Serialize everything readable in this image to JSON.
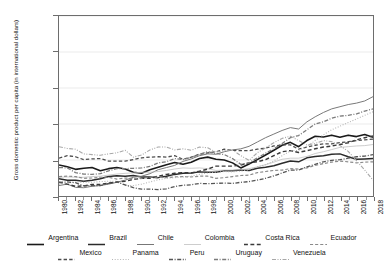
{
  "chart_data": {
    "type": "line",
    "title": "",
    "xlabel": "",
    "ylabel": "Gross domestic product per capita (in international dollars)",
    "grid": true,
    "legend_position": "bottom",
    "xlim": [
      1980,
      2018
    ],
    "ylim": [
      2000,
      27000
    ],
    "ytick_labels": [
      "2,000",
      "7,000",
      "12,000",
      "17,000",
      "22,000",
      "27,000"
    ],
    "ytick_values": [
      2000,
      7000,
      12000,
      17000,
      22000,
      27000
    ],
    "x": [
      1980,
      1981,
      1982,
      1983,
      1984,
      1985,
      1986,
      1987,
      1988,
      1989,
      1990,
      1991,
      1992,
      1993,
      1994,
      1995,
      1996,
      1997,
      1998,
      1999,
      2000,
      2001,
      2002,
      2003,
      2004,
      2005,
      2006,
      2007,
      2008,
      2009,
      2010,
      2011,
      2012,
      2013,
      2014,
      2015,
      2016,
      2017,
      2018
    ],
    "xtick_labels": [
      "1980",
      "1982",
      "1984",
      "1986",
      "1988",
      "1990",
      "1992",
      "1994",
      "1996",
      "1998",
      "2000",
      "2002",
      "2004",
      "2006",
      "2008",
      "2010",
      "2012",
      "2014",
      "2016",
      "2018"
    ],
    "series": [
      {
        "name": "Argentina",
        "style": "solid",
        "width": 1.6,
        "color": "#1a1a1a",
        "values": [
          6300,
          6050,
          5700,
          5850,
          5950,
          5500,
          5800,
          5950,
          5750,
          5300,
          5150,
          5650,
          6000,
          6350,
          6650,
          6400,
          6700,
          7200,
          7400,
          7100,
          7000,
          6600,
          5900,
          6450,
          7050,
          7700,
          8350,
          9050,
          9450,
          8850,
          9700,
          10300,
          10200,
          10450,
          10150,
          10450,
          10250,
          10550,
          10150
        ]
      },
      {
        "name": "Brazil",
        "style": "solid",
        "width": 1.5,
        "color": "#2b2b2b",
        "values": [
          4400,
          4200,
          4200,
          4050,
          4200,
          4400,
          4700,
          4800,
          4750,
          4850,
          4650,
          4650,
          4550,
          4750,
          5000,
          5150,
          5200,
          5350,
          5300,
          5300,
          5500,
          5500,
          5600,
          5550,
          5850,
          6000,
          6200,
          6550,
          6850,
          6750,
          7300,
          7500,
          7600,
          7800,
          7850,
          7450,
          7100,
          7150,
          7200
        ]
      },
      {
        "name": "Chile",
        "style": "solid",
        "width": 1.0,
        "color": "#777777",
        "values": [
          3450,
          3650,
          3200,
          3150,
          3350,
          3450,
          3650,
          3900,
          4200,
          4600,
          4750,
          5100,
          5650,
          5950,
          6250,
          6800,
          7150,
          7600,
          7850,
          7800,
          8150,
          8400,
          8550,
          8900,
          9500,
          10100,
          10600,
          11100,
          11500,
          11300,
          12300,
          13000,
          13600,
          14100,
          14400,
          14700,
          14900,
          15200,
          15800
        ]
      },
      {
        "name": "Colombia",
        "style": "solid",
        "width": 0.8,
        "color": "#c0c0c0",
        "values": [
          4600,
          4650,
          4600,
          4600,
          4700,
          4750,
          4900,
          5050,
          5150,
          5200,
          5300,
          5300,
          5400,
          5550,
          5750,
          5900,
          5850,
          5900,
          5800,
          5550,
          5600,
          5600,
          5650,
          5800,
          6050,
          6350,
          6700,
          7100,
          7250,
          7250,
          7500,
          7900,
          8150,
          8450,
          8750,
          8850,
          8950,
          9000,
          9150
        ]
      },
      {
        "name": "Costa Rica",
        "style": "dashed",
        "width": 1.5,
        "color": "#3a3a3a",
        "values": [
          3900,
          3650,
          3350,
          3400,
          3600,
          3600,
          3800,
          3950,
          4050,
          4300,
          4450,
          4450,
          4750,
          5000,
          5150,
          5250,
          5200,
          5450,
          5750,
          6150,
          6150,
          6150,
          6300,
          6600,
          6750,
          7050,
          7600,
          8150,
          8300,
          8050,
          8300,
          8550,
          8800,
          8950,
          9150,
          9400,
          9800,
          10100,
          10350
        ]
      },
      {
        "name": "Ecuador",
        "style": "dashed",
        "width": 1.2,
        "color": "#8a8a8a",
        "values": [
          4700,
          4750,
          4700,
          4450,
          4500,
          4600,
          4600,
          4350,
          4500,
          4400,
          4450,
          4600,
          4600,
          4550,
          4650,
          4700,
          4650,
          4750,
          4750,
          4450,
          4550,
          4700,
          4850,
          4900,
          5250,
          5400,
          5550,
          5600,
          5800,
          5750,
          5900,
          6250,
          6500,
          6700,
          6850,
          6750,
          6600,
          6700,
          6750
        ]
      },
      {
        "name": "Mexico",
        "style": "dashed",
        "width": 1.3,
        "color": "#4d4d4d",
        "values": [
          7250,
          7600,
          7450,
          7050,
          7150,
          7200,
          6850,
          6850,
          6850,
          7050,
          7300,
          7400,
          7450,
          7400,
          7600,
          7100,
          7400,
          7800,
          8000,
          8150,
          8500,
          8350,
          8300,
          8300,
          8500,
          8650,
          8950,
          9100,
          9100,
          8500,
          8800,
          9050,
          9250,
          9250,
          9400,
          9550,
          9700,
          9800,
          9900
        ]
      },
      {
        "name": "Panama",
        "style": "dotted",
        "width": 1.1,
        "color": "#b5b5b5",
        "values": [
          3650,
          3800,
          3950,
          3900,
          3900,
          4000,
          4050,
          4050,
          3450,
          3450,
          3650,
          3950,
          4250,
          4450,
          4550,
          4650,
          4750,
          5000,
          5200,
          5300,
          5400,
          5350,
          5450,
          5650,
          6050,
          6350,
          6850,
          7600,
          8250,
          8350,
          8850,
          9700,
          10500,
          11200,
          11700,
          12200,
          12700,
          13200,
          13700
        ]
      },
      {
        "name": "Peru",
        "style": "dashdot",
        "width": 1.3,
        "color": "#555555",
        "values": [
          3900,
          3950,
          3850,
          3400,
          3450,
          3450,
          3750,
          3950,
          3550,
          3150,
          2950,
          2950,
          2900,
          3000,
          3300,
          3500,
          3550,
          3750,
          3700,
          3750,
          3800,
          3750,
          3900,
          4000,
          4200,
          4450,
          4800,
          5200,
          5600,
          5600,
          6050,
          6400,
          6750,
          6950,
          7050,
          7250,
          7450,
          7550,
          7750
        ]
      },
      {
        "name": "Uruguay",
        "style": "dashdot",
        "width": 1.3,
        "color": "#7b7b7b",
        "values": [
          5950,
          5900,
          5250,
          5050,
          5000,
          5100,
          5500,
          5800,
          5800,
          5850,
          5900,
          6100,
          6600,
          6750,
          7200,
          7050,
          7350,
          7800,
          8150,
          7900,
          7750,
          7200,
          6400,
          6600,
          7300,
          7950,
          8550,
          9300,
          10100,
          10400,
          11200,
          12000,
          12300,
          12800,
          13100,
          13200,
          13400,
          13800,
          14100
        ]
      },
      {
        "name": "Venezuela",
        "style": "dashdotdot",
        "width": 1.1,
        "color": "#a8a8a8",
        "values": [
          8850,
          8600,
          8500,
          7850,
          7750,
          7650,
          7850,
          8000,
          8350,
          7400,
          7700,
          8400,
          8800,
          8800,
          8400,
          8550,
          8350,
          8800,
          8700,
          8100,
          8300,
          8400,
          7600,
          6950,
          8000,
          8700,
          9400,
          10000,
          10300,
          9700,
          9100,
          9300,
          9700,
          9550,
          9000,
          8200,
          6900,
          5600,
          4200
        ]
      }
    ]
  },
  "legend": {
    "row1": [
      {
        "label": "Argentina"
      },
      {
        "label": "Brazil"
      },
      {
        "label": "Chile"
      },
      {
        "label": "Colombia"
      },
      {
        "label": "Costa Rica"
      },
      {
        "label": "Ecuador"
      }
    ],
    "row2": [
      {
        "label": "Mexico"
      },
      {
        "label": "Panama"
      },
      {
        "label": "Peru"
      },
      {
        "label": "Uruguay"
      },
      {
        "label": "Venezuela"
      }
    ]
  }
}
